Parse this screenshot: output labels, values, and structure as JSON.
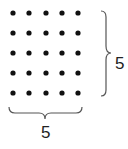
{
  "diagram": {
    "rows": 5,
    "columns": 5,
    "dot_color": "#111111",
    "brace_color": "#555555",
    "right_brace_label": "5",
    "bottom_brace_label": "5"
  }
}
